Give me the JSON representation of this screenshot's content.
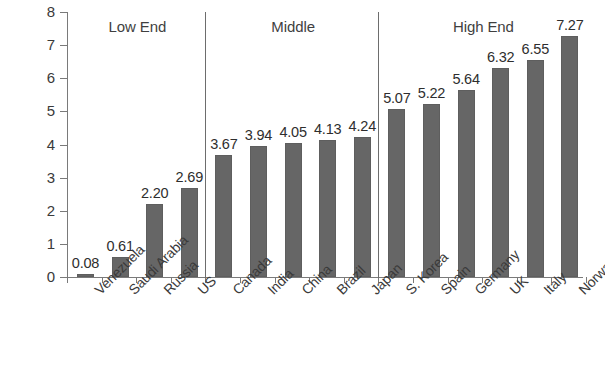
{
  "chart_data": {
    "type": "bar",
    "title": "",
    "subtitle": "",
    "xlabel": "",
    "ylabel": "",
    "ylim": [
      0,
      8
    ],
    "ytick_labels": [
      "8",
      "7",
      "6",
      "5",
      "4",
      "3",
      "2",
      "1",
      "0"
    ],
    "ytick_values": [
      8,
      7,
      6,
      5,
      4,
      3,
      2,
      1,
      0
    ],
    "grid": false,
    "legend": "none",
    "bar_color": "#666666",
    "categories": [
      "Venezuela",
      "Saudi Arabia",
      "Russia",
      "US",
      "Canada",
      "India",
      "China",
      "Brazil",
      "Japan",
      "S. Korea",
      "Spain",
      "Germany",
      "UK",
      "Italy",
      "Norway"
    ],
    "values": [
      0.08,
      0.61,
      2.2,
      2.69,
      3.67,
      3.94,
      4.05,
      4.13,
      4.24,
      5.07,
      5.22,
      5.64,
      6.32,
      6.55,
      7.27
    ],
    "value_labels": [
      "0.08",
      "0.61",
      "2.20",
      "2.69",
      "3.67",
      "3.94",
      "4.05",
      "4.13",
      "4.24",
      "5.07",
      "5.22",
      "5.64",
      "6.32",
      "6.55",
      "7.27"
    ],
    "groups": [
      {
        "label": "Low End",
        "start_index": 0,
        "end_index": 3
      },
      {
        "label": "Middle",
        "start_index": 4,
        "end_index": 8
      },
      {
        "label": "High End",
        "start_index": 9,
        "end_index": 14
      }
    ],
    "annotations": [
      "Low End",
      "Middle",
      "High End"
    ]
  }
}
